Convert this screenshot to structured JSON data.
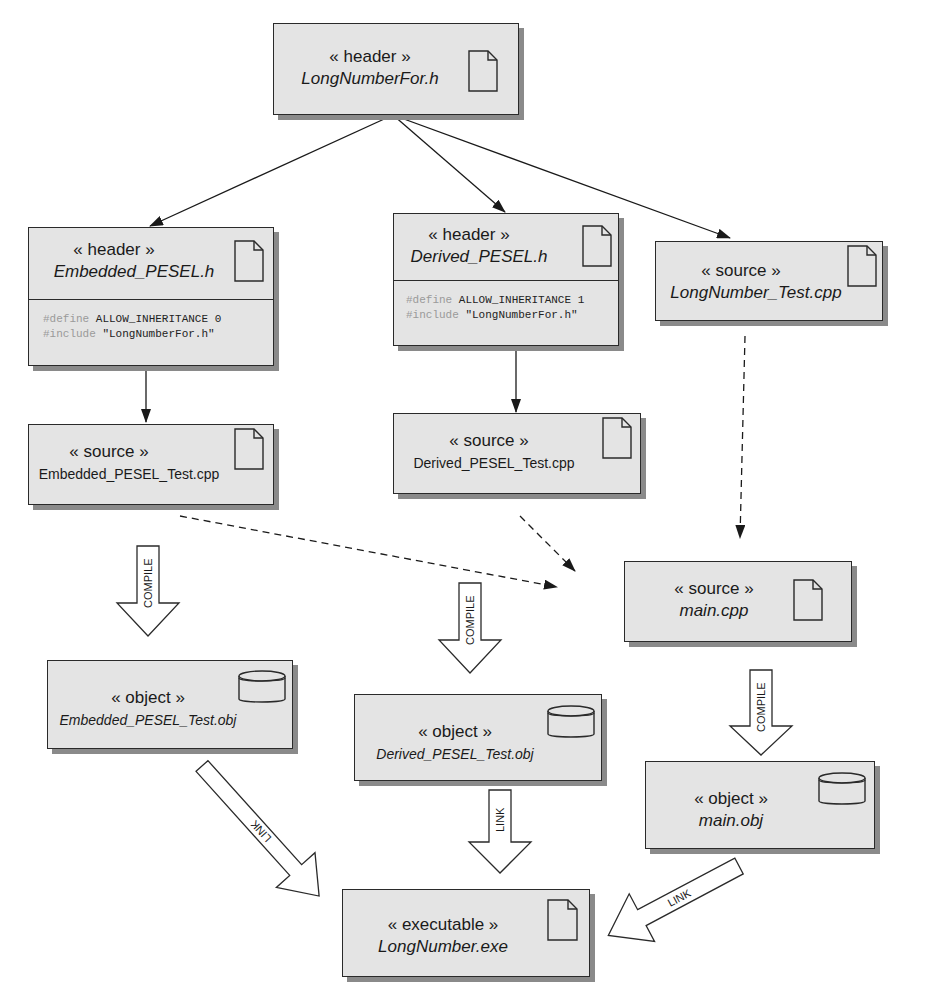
{
  "diagram": {
    "type": "UML artifact / build dependency diagram",
    "nodes": {
      "longnumberfor_h": {
        "stereotype": "« header »",
        "name": "LongNumberFor.h",
        "icon": "file-icon"
      },
      "embedded_pesel_h": {
        "stereotype": "« header »",
        "name": "Embedded_PESEL.h",
        "icon": "file-icon",
        "code": [
          {
            "directive": "#define",
            "rest": " ALLOW_INHERITANCE 0"
          },
          {
            "directive": "#include",
            "rest": " \"LongNumberFor.h\""
          }
        ]
      },
      "derived_pesel_h": {
        "stereotype": "« header »",
        "name": "Derived_PESEL.h",
        "icon": "file-icon",
        "code": [
          {
            "directive": "#define",
            "rest": " ALLOW_INHERITANCE 1"
          },
          {
            "directive": "#include",
            "rest": " \"LongNumberFor.h\""
          }
        ]
      },
      "longnumber_test_cpp": {
        "stereotype": "« source »",
        "name": "LongNumber_Test.cpp",
        "icon": "file-icon"
      },
      "embedded_pesel_test_cpp": {
        "stereotype": "« source »",
        "name": "Embedded_PESEL_Test.cpp",
        "icon": "file-icon"
      },
      "derived_pesel_test_cpp": {
        "stereotype": "« source »",
        "name": "Derived_PESEL_Test.cpp",
        "icon": "file-icon"
      },
      "main_cpp": {
        "stereotype": "« source »",
        "name": "main.cpp",
        "icon": "file-icon"
      },
      "embedded_pesel_test_obj": {
        "stereotype": "« object »",
        "name": "Embedded_PESEL_Test.obj",
        "icon": "database-icon"
      },
      "derived_pesel_test_obj": {
        "stereotype": "« object »",
        "name": "Derived_PESEL_Test.obj",
        "icon": "database-icon"
      },
      "main_obj": {
        "stereotype": "« object »",
        "name": "main.obj",
        "icon": "database-icon"
      },
      "longnumber_exe": {
        "stereotype": "« executable »",
        "name": "LongNumber.exe",
        "icon": "file-icon"
      }
    },
    "edges": [
      {
        "from": "LongNumberFor.h",
        "to": "Embedded_PESEL.h",
        "style": "solid"
      },
      {
        "from": "LongNumberFor.h",
        "to": "Derived_PESEL.h",
        "style": "solid"
      },
      {
        "from": "LongNumberFor.h",
        "to": "LongNumber_Test.cpp",
        "style": "solid"
      },
      {
        "from": "Embedded_PESEL.h",
        "to": "Embedded_PESEL_Test.cpp",
        "style": "solid"
      },
      {
        "from": "Derived_PESEL.h",
        "to": "Derived_PESEL_Test.cpp",
        "style": "solid"
      },
      {
        "from": "LongNumber_Test.cpp",
        "to": "main.cpp",
        "style": "dashed"
      },
      {
        "from": "Embedded_PESEL_Test.cpp",
        "to": "main.cpp",
        "style": "dashed"
      },
      {
        "from": "Derived_PESEL_Test.cpp",
        "to": "main.cpp",
        "style": "dashed"
      }
    ],
    "block_arrows": [
      {
        "label": "COMPILE",
        "from": "Embedded_PESEL_Test.cpp",
        "to": "Embedded_PESEL_Test.obj"
      },
      {
        "label": "COMPILE",
        "from": "Derived_PESEL_Test.cpp",
        "to": "Derived_PESEL_Test.obj"
      },
      {
        "label": "COMPILE",
        "from": "main.cpp",
        "to": "main.obj"
      },
      {
        "label": "LINK",
        "from": "Embedded_PESEL_Test.obj",
        "to": "LongNumber.exe"
      },
      {
        "label": "LINK",
        "from": "Derived_PESEL_Test.obj",
        "to": "LongNumber.exe"
      },
      {
        "label": "LINK",
        "from": "main.obj",
        "to": "LongNumber.exe"
      }
    ],
    "colors": {
      "node_fill": "#e4e4e4",
      "border": "#2a2a2a",
      "shadow": "#8a8a8a",
      "code_keyword": "#9a9a9a"
    }
  }
}
